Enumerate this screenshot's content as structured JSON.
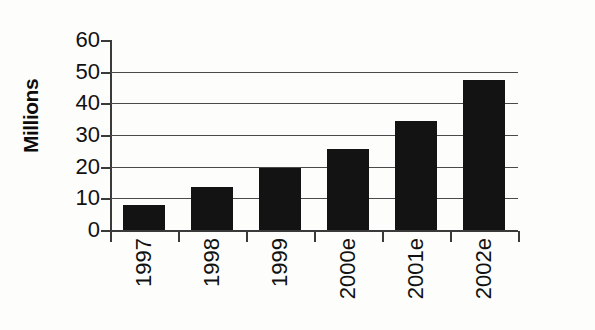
{
  "chart_data": {
    "type": "bar",
    "title": "",
    "subtitle": "",
    "xlabel": "",
    "ylabel": "Millions",
    "categories": [
      "1997",
      "1998",
      "1999",
      "2000e",
      "2001e",
      "2002e"
    ],
    "values": [
      8,
      13.7,
      19.7,
      25.7,
      34.5,
      47.5
    ],
    "series": [
      {
        "name": "Millions",
        "values": [
          8,
          13.7,
          19.7,
          25.7,
          34.5,
          47.5
        ]
      }
    ],
    "ylim": [
      0,
      60
    ],
    "ytick_labels": [
      "60",
      "50",
      "40",
      "30",
      "20",
      "10",
      "0"
    ],
    "ytick_values": [
      60,
      50,
      40,
      30,
      20,
      10,
      0
    ],
    "gridlines": [
      10,
      20,
      30,
      40,
      50
    ],
    "grid": "horizontal",
    "legend": "none",
    "bar_color": "#131313",
    "axis_color": "#3a3a3a",
    "grid_color": "#4a4a4a",
    "background_color": "#fdfdfb",
    "xlabel_rotation": -90
  }
}
